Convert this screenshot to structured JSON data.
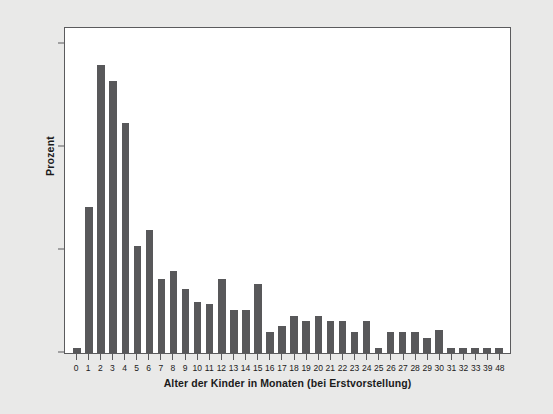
{
  "chart_data": {
    "type": "bar",
    "title": "",
    "subtitle": "",
    "xlabel": "Alter der Kinder in Monaten (bei Erstvorstellung)",
    "ylabel": "Prozent",
    "ylim": [
      0,
      15.8
    ],
    "yticks": [
      0,
      5,
      10,
      15
    ],
    "ytick_labels": [
      "0",
      "5",
      "10",
      "15"
    ],
    "grid": false,
    "legend": null,
    "bar_color": "#58585a",
    "plot_background": "#ffffff",
    "figure_background": "#e9e9e8",
    "axis_color": "#5b5b5d",
    "categories": [
      "0",
      "1",
      "2",
      "3",
      "4",
      "5",
      "6",
      "7",
      "8",
      "9",
      "10",
      "11",
      "12",
      "13",
      "14",
      "15",
      "16",
      "17",
      "18",
      "19",
      "20",
      "21",
      "22",
      "23",
      "24",
      "25",
      "26",
      "27",
      "28",
      "29",
      "30",
      "31",
      "32",
      "33",
      "39",
      "48"
    ],
    "values": [
      0.25,
      7.1,
      14.0,
      13.2,
      11.2,
      5.2,
      6.0,
      3.6,
      4.0,
      3.1,
      2.5,
      2.4,
      3.6,
      2.1,
      2.1,
      3.35,
      1.0,
      1.3,
      1.8,
      1.55,
      1.8,
      1.55,
      1.55,
      1.0,
      1.55,
      0.25,
      1.0,
      1.0,
      1.0,
      0.75,
      1.1,
      0.25,
      0.25,
      0.25,
      0.25,
      0.25
    ],
    "series": [
      {
        "name": "Prozent",
        "values": [
          0.25,
          7.1,
          14.0,
          13.2,
          11.2,
          5.2,
          6.0,
          3.6,
          4.0,
          3.1,
          2.5,
          2.4,
          3.6,
          2.1,
          2.1,
          3.35,
          1.0,
          1.3,
          1.8,
          1.55,
          1.8,
          1.55,
          1.55,
          1.0,
          1.55,
          0.25,
          1.0,
          1.0,
          1.0,
          0.75,
          1.1,
          0.25,
          0.25,
          0.25,
          0.25,
          0.25
        ]
      }
    ]
  }
}
